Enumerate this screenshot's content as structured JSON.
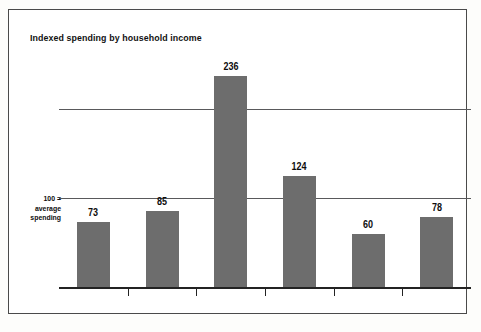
{
  "chart_data": {
    "type": "bar",
    "title": "Indexed spending by household income",
    "xlabel": "",
    "ylabel": "",
    "categories": [
      "<$20,000",
      "$20,000–$29,999",
      "$30,000–$39,999",
      "$40,000–$49,999",
      "$50,000–$69,999",
      "$70,000+"
    ],
    "values": [
      73,
      85,
      236,
      124,
      60,
      78
    ],
    "ylim": [
      0,
      260
    ],
    "gridlines": [
      100,
      200
    ],
    "grid": true,
    "legend": false,
    "annotations": [
      {
        "text": "100 =",
        "target": 100
      },
      {
        "text": "average",
        "target": 100
      },
      {
        "text": "spending",
        "target": 100
      }
    ],
    "bar_color": "#6d6d6d",
    "axis_color": "#232323",
    "gridline_color": "#59595b"
  },
  "axis_note": {
    "line1": "100 =",
    "line2": "average",
    "line3": "spending"
  }
}
